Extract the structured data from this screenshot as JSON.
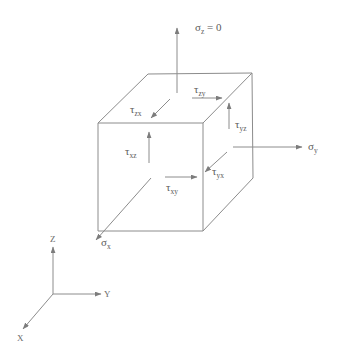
{
  "diagram": {
    "stresses": {
      "sigma_z": {
        "symbol": "σ",
        "sub": "z",
        "suffix": " = 0"
      },
      "sigma_y": {
        "symbol": "σ",
        "sub": "y"
      },
      "sigma_x": {
        "symbol": "σ",
        "sub": "x"
      },
      "tau_zy": {
        "symbol": "τ",
        "sub": "zy"
      },
      "tau_zx": {
        "symbol": "τ",
        "sub": "zx"
      },
      "tau_yz": {
        "symbol": "τ",
        "sub": "yz"
      },
      "tau_xz": {
        "symbol": "τ",
        "sub": "xz"
      },
      "tau_yx": {
        "symbol": "τ",
        "sub": "yx"
      },
      "tau_xy": {
        "symbol": "τ",
        "sub": "xy"
      }
    },
    "axes": {
      "z": "Z",
      "y": "Y",
      "x": "X"
    },
    "colors": {
      "line": "#8c8c8c",
      "text": "#5a5a5a"
    }
  }
}
